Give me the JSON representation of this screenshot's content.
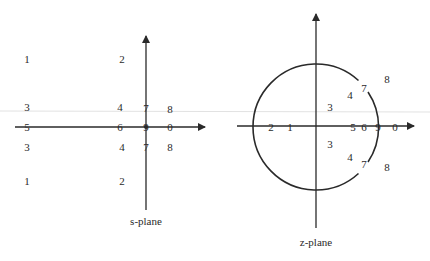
{
  "artifact": {
    "color": "#e2e2e2",
    "y": 111
  },
  "s_plane": {
    "caption": "s-plane",
    "axis_color": "#2a2a2a",
    "points": [
      {
        "label": "1",
        "x": 27,
        "y": 63
      },
      {
        "label": "2",
        "x": 122,
        "y": 63
      },
      {
        "label": "3",
        "x": 27,
        "y": 111
      },
      {
        "label": "4",
        "x": 120,
        "y": 111
      },
      {
        "label": "7",
        "x": 146,
        "y": 112
      },
      {
        "label": "8",
        "x": 170,
        "y": 113
      },
      {
        "label": "5",
        "x": 27,
        "y": 131
      },
      {
        "label": "6",
        "x": 120,
        "y": 131
      },
      {
        "label": "9",
        "x": 146,
        "y": 131
      },
      {
        "label": "0",
        "x": 170,
        "y": 131
      },
      {
        "label": "3",
        "x": 27,
        "y": 151
      },
      {
        "label": "4",
        "x": 122,
        "y": 151
      },
      {
        "label": "7",
        "x": 146,
        "y": 151
      },
      {
        "label": "8",
        "x": 170,
        "y": 151
      },
      {
        "label": "1",
        "x": 27,
        "y": 185
      },
      {
        "label": "2",
        "x": 122,
        "y": 185
      }
    ]
  },
  "z_plane": {
    "caption": "z-plane",
    "axis_color": "#2a2a2a",
    "unit_circle": {
      "cx": 316,
      "cy": 127,
      "r": 63
    },
    "points": [
      {
        "label": "8",
        "x": 387,
        "y": 83
      },
      {
        "label": "7",
        "x": 364,
        "y": 92
      },
      {
        "label": "4",
        "x": 350,
        "y": 99
      },
      {
        "label": "3",
        "x": 330,
        "y": 111
      },
      {
        "label": "2",
        "x": 271,
        "y": 131
      },
      {
        "label": "1",
        "x": 290,
        "y": 131
      },
      {
        "label": "5",
        "x": 353,
        "y": 131
      },
      {
        "label": "6",
        "x": 364,
        "y": 131
      },
      {
        "label": "9",
        "x": 378,
        "y": 131
      },
      {
        "label": "0",
        "x": 395,
        "y": 131
      },
      {
        "label": "3",
        "x": 330,
        "y": 148
      },
      {
        "label": "4",
        "x": 350,
        "y": 161
      },
      {
        "label": "7",
        "x": 364,
        "y": 168
      },
      {
        "label": "8",
        "x": 387,
        "y": 171
      }
    ]
  }
}
